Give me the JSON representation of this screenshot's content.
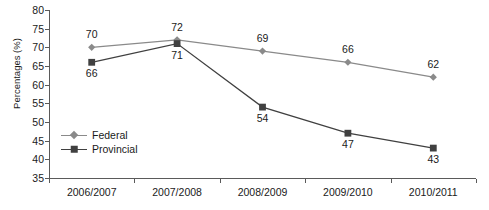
{
  "chart_data": {
    "type": "line",
    "title": "",
    "xlabel": "",
    "ylabel": "Percentages (%)",
    "categories": [
      "2006/2007",
      "2007/2008",
      "2008/2009",
      "2009/2010",
      "2010/2011"
    ],
    "ylim": [
      35,
      80
    ],
    "yticks": [
      35,
      40,
      45,
      50,
      55,
      60,
      65,
      70,
      75,
      80
    ],
    "grid": false,
    "legend_position": "inside lower-left",
    "series": [
      {
        "name": "Federal",
        "values": [
          70,
          72,
          69,
          66,
          62
        ],
        "color": "#8a8a8a",
        "marker": "diamond",
        "label_position": "above"
      },
      {
        "name": "Provincial",
        "values": [
          66,
          71,
          54,
          47,
          43
        ],
        "color": "#404040",
        "marker": "square",
        "label_position": "below"
      }
    ]
  },
  "axis": {
    "ylabel": "Percentages (%)",
    "ytick_labels": [
      "80",
      "75",
      "70",
      "65",
      "60",
      "55",
      "50",
      "45",
      "40",
      "35"
    ],
    "xtick_labels": [
      "2006/2007",
      "2007/2008",
      "2008/2009",
      "2009/2010",
      "2010/2011"
    ]
  },
  "legend": {
    "items": [
      {
        "label": "Federal"
      },
      {
        "label": "Provincial"
      }
    ]
  },
  "labels": {
    "federal": [
      "70",
      "72",
      "69",
      "66",
      "62"
    ],
    "provincial": [
      "66",
      "71",
      "54",
      "47",
      "43"
    ]
  },
  "colors": {
    "federal": "#8a8a8a",
    "provincial": "#404040",
    "axis": "#5a5a5a",
    "text": "#1a1a1a",
    "background": "#ffffff"
  }
}
